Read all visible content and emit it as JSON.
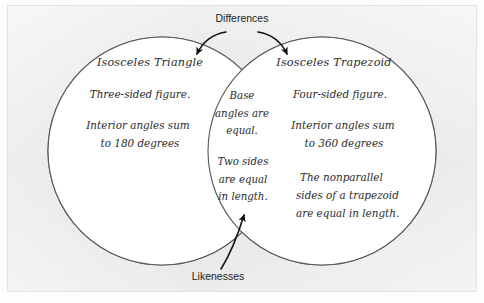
{
  "diagram": {
    "kind": "venn-diagram",
    "background_color": "#e9e9e9",
    "circle_fill": "#ffffff",
    "circle_stroke": "#5a5a5a",
    "ink_color": "#2b2b2b",
    "callout_color": "#1c1c1c",
    "callouts": {
      "top": "Differences",
      "bottom": "Likenesses"
    },
    "left_circle": {
      "title": "Isosceles Triangle",
      "items": [
        "Three-sided figure.",
        "Interior angles sum",
        "to 180 degrees"
      ]
    },
    "right_circle": {
      "title": "Isosceles Trapezoid",
      "items": [
        "Four-sided figure.",
        "Interior angles sum",
        "to 360 degrees",
        "The nonparallel",
        "sides of a trapezoid",
        "are equal in length."
      ]
    },
    "overlap": {
      "group_one": [
        "Base",
        "angles are",
        "equal."
      ],
      "group_two": [
        "Two sides",
        "are equal",
        "in length."
      ]
    }
  }
}
